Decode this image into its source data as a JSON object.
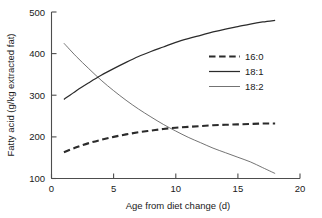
{
  "chart_data": {
    "type": "line",
    "title": "",
    "xlabel": "Age from diet change (d)",
    "ylabel": "Fatty acid (g/kg extracted fat)",
    "xlim": [
      0,
      20
    ],
    "ylim": [
      100,
      500
    ],
    "xticks": [
      0,
      5,
      10,
      15,
      20
    ],
    "yticks": [
      100,
      200,
      300,
      400,
      500
    ],
    "xtick_labels": [
      "0",
      "5",
      "10",
      "15",
      "20"
    ],
    "ytick_labels": [
      "100",
      "200",
      "300",
      "400",
      "500"
    ],
    "grid": false,
    "legend_position": "right-upper",
    "x": [
      1,
      2,
      3,
      4,
      5,
      6,
      7,
      8,
      9,
      10,
      11,
      12,
      13,
      14,
      15,
      16,
      17,
      18
    ],
    "series": [
      {
        "name": "16:0",
        "style": "dashed",
        "color": "#2b2b2b",
        "values": [
          163,
          175,
          185,
          193,
          200,
          206,
          211,
          215,
          219,
          222,
          224,
          226,
          228,
          229,
          230,
          231,
          232,
          232
        ]
      },
      {
        "name": "18:1",
        "style": "solid",
        "color": "#2b2b2b",
        "values": [
          290,
          311,
          330,
          348,
          364,
          379,
          393,
          405,
          416,
          427,
          436,
          444,
          452,
          459,
          465,
          471,
          476,
          480
        ]
      },
      {
        "name": "18:2",
        "style": "thin",
        "color": "#5a5a5a",
        "values": [
          425,
          393,
          364,
          336,
          311,
          288,
          267,
          248,
          230,
          214,
          199,
          186,
          173,
          162,
          151,
          140,
          126,
          112
        ]
      }
    ]
  },
  "legend": {
    "entries": [
      {
        "label": "16:0"
      },
      {
        "label": "18:1"
      },
      {
        "label": "18:2"
      }
    ]
  }
}
